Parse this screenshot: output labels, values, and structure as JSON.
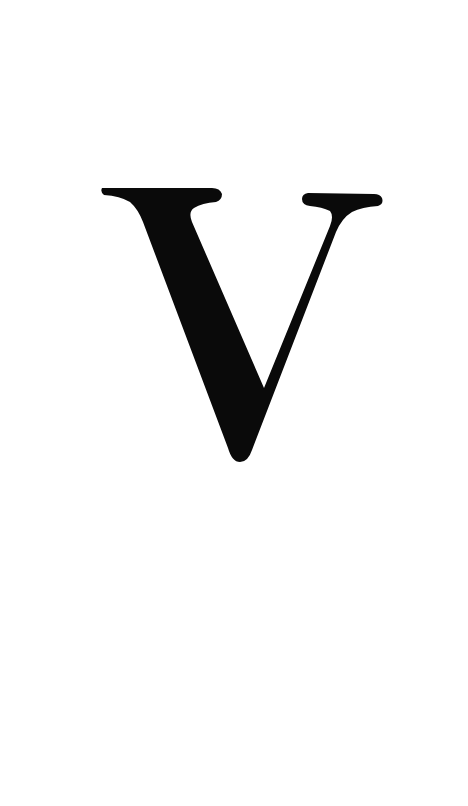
{
  "splash": {
    "logo_letter": "V",
    "logo_icon": "serif-letter-v-logo",
    "background_color": "#ffffff",
    "logo_color": "#0a0a0a"
  }
}
